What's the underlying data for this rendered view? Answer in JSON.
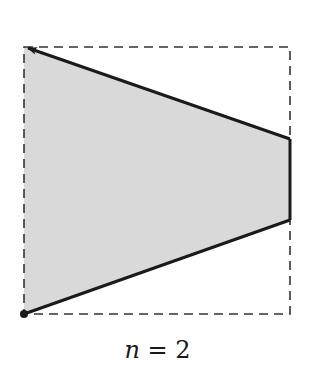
{
  "diagram": {
    "caption": {
      "variable": "n",
      "equals": " = ",
      "value": "2"
    },
    "bounding_box": {
      "x": 24,
      "y": 47,
      "width": 266,
      "height": 267,
      "style": "dashed",
      "color": "#333333"
    },
    "polygon": {
      "fill": "#d9d9d9",
      "stroke": "#1a1a1a",
      "points": [
        [
          24,
          47
        ],
        [
          290,
          139
        ],
        [
          290,
          220
        ],
        [
          24,
          314
        ]
      ]
    },
    "start_point": {
      "x": 24,
      "y": 314,
      "label": "origin-dot"
    },
    "arrow": {
      "from": [
        290,
        139
      ],
      "to": [
        24,
        47
      ]
    }
  }
}
